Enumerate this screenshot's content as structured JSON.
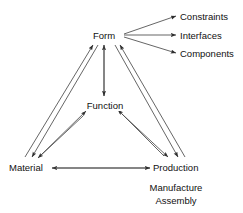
{
  "diagram": {
    "background_color": "#ffffff",
    "line_color": "#3a3a3a",
    "text_color": "#111111",
    "nodes": {
      "form": "Form",
      "function": "Function",
      "material": "Material",
      "production": "Production"
    },
    "form_outputs": [
      "Constraints",
      "Interfaces",
      "Components"
    ],
    "production_details": [
      "Manufacture",
      "Assembly"
    ]
  }
}
